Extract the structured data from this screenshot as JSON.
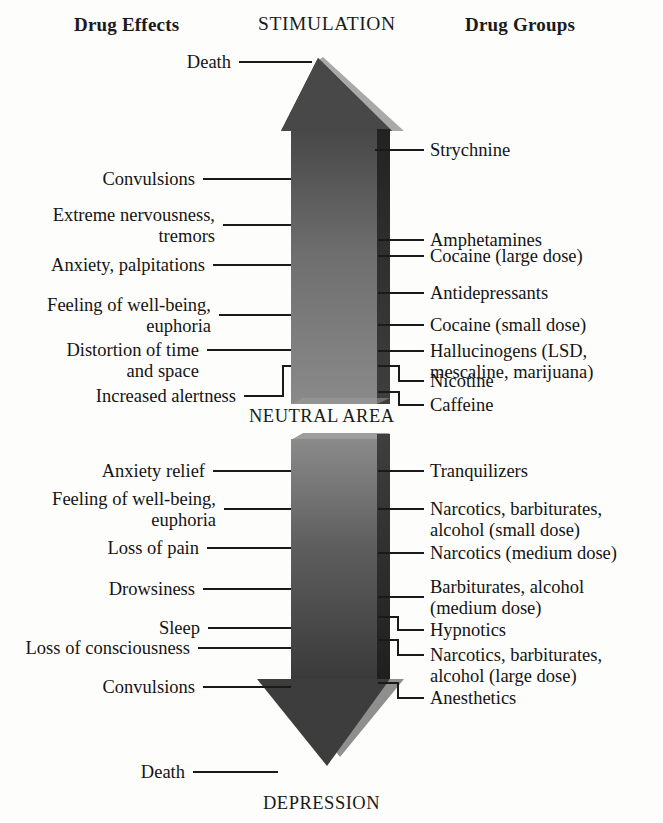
{
  "headers": {
    "left": "Drug Effects",
    "top": "STIMULATION",
    "right": "Drug Groups"
  },
  "axis_labels": {
    "neutral": "NEUTRAL AREA",
    "bottom": "DEPRESSION"
  },
  "colors": {
    "arrow_fill_top": "#4a4a4a",
    "arrow_fill_mid": "#7b7b7b",
    "arrow_fill_bottom": "#3c3c3c",
    "arrow_edge_dark": "#2b2b2b",
    "arrow_edge_light": "#a8a8a8",
    "line": "#1a1a1a",
    "text": "#141414",
    "background": "#fdfdfb"
  },
  "chart_data": {
    "type": "diagram",
    "axis": "Stimulation (up) to Depression (down), with a Neutral Area in the middle",
    "left_column_title": "Drug Effects",
    "right_column_title": "Drug Groups",
    "stimulation_effects": [
      "Death",
      "Convulsions",
      "Extreme nervousness, tremors",
      "Anxiety, palpitations",
      "Feeling of well-being, euphoria",
      "Distortion of time and space",
      "Increased alertness"
    ],
    "stimulation_groups": [
      "Strychnine",
      "Amphetamines",
      "Cocaine (large dose)",
      "Antidepressants",
      "Cocaine (small dose)",
      "Hallucinogens (LSD, mescaline, marijuana)",
      "Nicotine",
      "Caffeine"
    ],
    "depression_effects": [
      "Anxiety relief",
      "Feeling of well-being, euphoria",
      "Loss of pain",
      "Drowsiness",
      "Sleep",
      "Loss of consciousness",
      "Convulsions",
      "Death"
    ],
    "depression_groups": [
      "Tranquilizers",
      "Narcotics, barbiturates, alcohol (small dose)",
      "Narcotics (medium dose)",
      "Barbiturates, alcohol (medium dose)",
      "Hypnotics",
      "Narcotics, barbiturates, alcohol (large dose)",
      "Anesthetics"
    ]
  },
  "left_labels": [
    {
      "id": "death-top",
      "lines": [
        "Death"
      ]
    },
    {
      "id": "convulsions-top",
      "lines": [
        "Convulsions"
      ]
    },
    {
      "id": "extreme-nervousness",
      "lines": [
        "Extreme nervousness,",
        "tremors"
      ]
    },
    {
      "id": "anxiety-palpitations",
      "lines": [
        "Anxiety, palpitations"
      ]
    },
    {
      "id": "wellbeing-top",
      "lines": [
        "Feeling of well-being,",
        "euphoria"
      ]
    },
    {
      "id": "distortion",
      "lines": [
        "Distortion of time",
        "and space"
      ]
    },
    {
      "id": "increased-alertness",
      "lines": [
        "Increased alertness"
      ]
    },
    {
      "id": "anxiety-relief",
      "lines": [
        "Anxiety relief"
      ]
    },
    {
      "id": "wellbeing-bottom",
      "lines": [
        "Feeling of well-being,",
        "euphoria"
      ]
    },
    {
      "id": "loss-of-pain",
      "lines": [
        "Loss of pain"
      ]
    },
    {
      "id": "drowsiness",
      "lines": [
        "Drowsiness"
      ]
    },
    {
      "id": "sleep",
      "lines": [
        "Sleep"
      ]
    },
    {
      "id": "loss-consciousness",
      "lines": [
        "Loss of consciousness"
      ]
    },
    {
      "id": "convulsions-bottom",
      "lines": [
        "Convulsions"
      ]
    },
    {
      "id": "death-bottom",
      "lines": [
        "Death"
      ]
    }
  ],
  "right_labels": [
    {
      "id": "strychnine",
      "lines": [
        "Strychnine"
      ]
    },
    {
      "id": "amphetamines",
      "lines": [
        "Amphetamines"
      ]
    },
    {
      "id": "cocaine-large",
      "lines": [
        "Cocaine (large dose)"
      ]
    },
    {
      "id": "antidepressants",
      "lines": [
        "Antidepressants"
      ]
    },
    {
      "id": "cocaine-small",
      "lines": [
        "Cocaine (small dose)"
      ]
    },
    {
      "id": "hallucinogens",
      "lines": [
        "Hallucinogens (LSD,",
        "mescaline, marijuana)"
      ]
    },
    {
      "id": "nicotine",
      "lines": [
        "Nicotine"
      ]
    },
    {
      "id": "caffeine",
      "lines": [
        "Caffeine"
      ]
    },
    {
      "id": "tranquilizers",
      "lines": [
        "Tranquilizers"
      ]
    },
    {
      "id": "narcotics-small",
      "lines": [
        "Narcotics, barbiturates,",
        "alcohol (small dose)"
      ]
    },
    {
      "id": "narcotics-medium",
      "lines": [
        "Narcotics (medium dose)"
      ]
    },
    {
      "id": "barbiturates-med",
      "lines": [
        "Barbiturates, alcohol",
        "(medium dose)"
      ]
    },
    {
      "id": "hypnotics",
      "lines": [
        "Hypnotics"
      ]
    },
    {
      "id": "narcotics-large",
      "lines": [
        "Narcotics, barbiturates,",
        "alcohol (large dose)"
      ]
    },
    {
      "id": "anesthetics",
      "lines": [
        "Anesthetics"
      ]
    }
  ]
}
